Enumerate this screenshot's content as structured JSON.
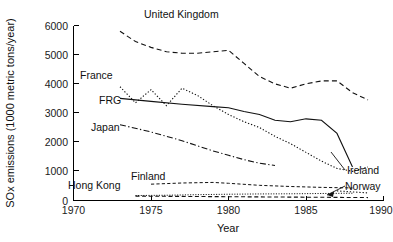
{
  "chart_data": {
    "type": "line",
    "title": "",
    "xlabel": "Year",
    "ylabel": "SOx emissions (1000 metric tons/year)",
    "xlim": [
      1970,
      1990
    ],
    "ylim": [
      0,
      6000
    ],
    "xticks": [
      1970,
      1975,
      1980,
      1985,
      1990
    ],
    "yticks": [
      0,
      1000,
      2000,
      3000,
      4000,
      5000,
      6000
    ],
    "xtick_labels": [
      "1970",
      "1975",
      "1980",
      "1985",
      "1990"
    ],
    "ytick_labels": [
      "0",
      "1000",
      "2000",
      "3000",
      "4000",
      "5000",
      "6000"
    ],
    "grid": false,
    "legend": "inline-labels",
    "series": [
      {
        "name": "United Kingdom",
        "style": "dashed",
        "label_x": 1978.2,
        "label_y": 5900,
        "x": [
          1973,
          1974,
          1975,
          1976,
          1977,
          1978,
          1979,
          1980,
          1981,
          1982,
          1983,
          1984,
          1985,
          1986,
          1987,
          1988,
          1989
        ],
        "values": [
          5800,
          5450,
          5250,
          5100,
          5050,
          5050,
          5100,
          5150,
          4700,
          4250,
          4000,
          3850,
          4000,
          4100,
          4100,
          3700,
          3450
        ]
      },
      {
        "name": "France",
        "style": "dotted",
        "label_x": 1973.0,
        "label_y": 4150,
        "x": [
          1973,
          1974,
          1975,
          1976,
          1977,
          1978,
          1979,
          1980,
          1981,
          1982,
          1983,
          1984,
          1985,
          1986,
          1987,
          1988,
          1989
        ],
        "values": [
          3900,
          3350,
          3800,
          3250,
          3850,
          3600,
          3250,
          2950,
          2700,
          2500,
          2200,
          1950,
          1650,
          1350,
          1100,
          1000,
          1150
        ]
      },
      {
        "name": "FRG",
        "style": "solid",
        "label_x": 1974.3,
        "label_y": 3350,
        "x": [
          1973,
          1975,
          1977,
          1979,
          1980,
          1981,
          1982,
          1983,
          1984,
          1985,
          1986,
          1987,
          1988
        ],
        "values": [
          3500,
          3400,
          3300,
          3220,
          3180,
          3050,
          2950,
          2750,
          2700,
          2800,
          2750,
          2300,
          1150
        ]
      },
      {
        "name": "Japan",
        "style": "dashdot",
        "label_x": 1974.0,
        "label_y": 2400,
        "x": [
          1973,
          1975,
          1977,
          1979,
          1980,
          1981,
          1982,
          1983
        ],
        "values": [
          2600,
          2350,
          2050,
          1700,
          1550,
          1400,
          1280,
          1200
        ]
      },
      {
        "name": "Finland",
        "style": "finedash",
        "label_x": 1976.0,
        "label_y": 800,
        "x": [
          1975,
          1977,
          1979,
          1980,
          1982,
          1984,
          1986,
          1988
        ],
        "values": [
          560,
          600,
          620,
          590,
          520,
          480,
          450,
          430
        ]
      },
      {
        "name": "Hong Kong",
        "style": "tiny",
        "label_x": 1971.2,
        "label_y": 520,
        "x": [
          1974,
          1976,
          1978,
          1980,
          1982,
          1984,
          1986,
          1988
        ],
        "values": [
          170,
          180,
          200,
          215,
          225,
          230,
          240,
          250
        ]
      },
      {
        "name": "Norway",
        "style": "dashed-low",
        "label_x": 1987.8,
        "label_y": 300,
        "x": [
          1974,
          1977,
          1980,
          1983,
          1986,
          1989
        ],
        "values": [
          150,
          140,
          130,
          120,
          110,
          100
        ]
      },
      {
        "name": "Ireland",
        "style": "dotted-end",
        "label_x": 1987.8,
        "label_y": 600,
        "x": [
          1987,
          1989
        ],
        "values": [
          330,
          260
        ]
      }
    ],
    "annotations": [
      {
        "text": "United Kingdom",
        "kind": "series-label"
      },
      {
        "text": "France",
        "kind": "series-label"
      },
      {
        "text": "FRG",
        "kind": "series-label"
      },
      {
        "text": "Japan",
        "kind": "series-label"
      },
      {
        "text": "Finland",
        "kind": "series-label"
      },
      {
        "text": "Hong Kong",
        "kind": "series-label"
      },
      {
        "text": "Ireland",
        "kind": "series-label-leader"
      },
      {
        "text": "Norway",
        "kind": "series-label-leader"
      }
    ]
  },
  "labels": {
    "xaxis_title": "Year",
    "yaxis_title": "SOx emissions (1000 metric tons/year)",
    "united_kingdom": "United Kingdom",
    "france": "France",
    "frg": "FRG",
    "japan": "Japan",
    "finland": "Finland",
    "hong_kong": "Hong Kong",
    "ireland": "Ireland",
    "norway": "Norway"
  },
  "ticks": {
    "y": [
      "6000",
      "5000",
      "4000",
      "3000",
      "2000",
      "1000",
      "0"
    ],
    "x": [
      "1970",
      "1975",
      "1980",
      "1985",
      "1990"
    ]
  },
  "colors": {
    "ink": "#111111",
    "background": "#ffffff"
  }
}
